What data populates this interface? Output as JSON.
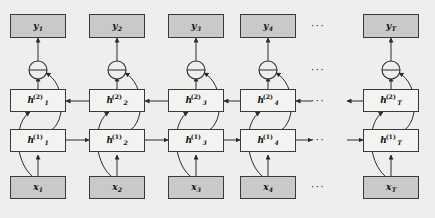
{
  "figure": {
    "background_color": "#eeeeec",
    "box_border_color": "#3a3a3a",
    "io_fill_color": "#c9c9c9",
    "hidden_fill_color": "#f3f3f1",
    "arrow_color": "#2b2b2b"
  },
  "rows": {
    "output": {
      "name": "output-layer",
      "label": "y"
    },
    "sum": {
      "name": "sum-layer",
      "symbol": "+"
    },
    "hidden2": {
      "name": "hidden-layer-2",
      "label": "h",
      "superscript": "(2)",
      "direction": "backward"
    },
    "hidden1": {
      "name": "hidden-layer-1",
      "label": "h",
      "superscript": "(1)",
      "direction": "forward"
    },
    "input": {
      "name": "input-layer",
      "label": "x"
    }
  },
  "timesteps": [
    {
      "index": "1",
      "output": {
        "base": "y",
        "sub": "1",
        "sup": ""
      },
      "hidden2": {
        "base": "h",
        "sub": "1",
        "sup": "(2)"
      },
      "hidden1": {
        "base": "h",
        "sub": "1",
        "sup": "(1)"
      },
      "input": {
        "base": "x",
        "sub": "1",
        "sup": ""
      }
    },
    {
      "index": "2",
      "output": {
        "base": "y",
        "sub": "2",
        "sup": ""
      },
      "hidden2": {
        "base": "h",
        "sub": "2",
        "sup": "(2)"
      },
      "hidden1": {
        "base": "h",
        "sub": "2",
        "sup": "(1)"
      },
      "input": {
        "base": "x",
        "sub": "2",
        "sup": ""
      }
    },
    {
      "index": "3",
      "output": {
        "base": "y",
        "sub": "3",
        "sup": ""
      },
      "hidden2": {
        "base": "h",
        "sub": "3",
        "sup": "(2)"
      },
      "hidden1": {
        "base": "h",
        "sub": "3",
        "sup": "(1)"
      },
      "input": {
        "base": "x",
        "sub": "3",
        "sup": ""
      }
    },
    {
      "index": "4",
      "output": {
        "base": "y",
        "sub": "4",
        "sup": ""
      },
      "hidden2": {
        "base": "h",
        "sub": "4",
        "sup": "(2)"
      },
      "hidden1": {
        "base": "h",
        "sub": "4",
        "sup": "(1)"
      },
      "input": {
        "base": "x",
        "sub": "4",
        "sup": ""
      }
    },
    {
      "index": "T",
      "output": {
        "base": "y",
        "sub": "T",
        "sup": ""
      },
      "hidden2": {
        "base": "h",
        "sub": "T",
        "sup": "(2)"
      },
      "hidden1": {
        "base": "h",
        "sub": "T",
        "sup": "(1)"
      },
      "input": {
        "base": "x",
        "sub": "T",
        "sup": ""
      }
    }
  ],
  "ellipses": {
    "glyph": "···",
    "rows": [
      "output",
      "sum",
      "hidden2",
      "hidden1",
      "input"
    ]
  },
  "sum_symbol": "⊕"
}
